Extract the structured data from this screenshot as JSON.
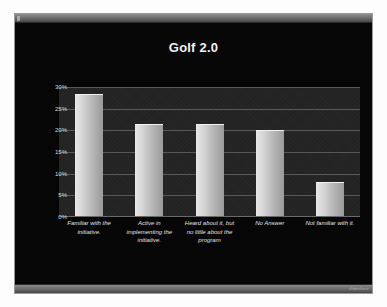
{
  "window": {
    "titlebar_label": "",
    "watermark": "slideshare"
  },
  "slide": {
    "title": "Golf 2.0"
  },
  "chart_data": {
    "type": "bar",
    "title": "Golf 2.0",
    "xlabel": "",
    "ylabel": "",
    "ylim": [
      0,
      30
    ],
    "grid": true,
    "legend": "none",
    "tick_format": "percent",
    "yticks": [
      "30%",
      "25%",
      "20%",
      "15%",
      "10%",
      "5%",
      "0%"
    ],
    "ytick_values": [
      30,
      25,
      20,
      15,
      10,
      5,
      0
    ],
    "categories": [
      "Familiar with the initiative.",
      "Active in implementing the initiative.",
      "Heard about it, but no little about the program",
      "No Answer",
      "Not familiar with it."
    ],
    "values": [
      28.5,
      21.5,
      21.5,
      20,
      8
    ],
    "bar_color": "#cfcfcf",
    "plot_background": "#242424",
    "slide_background": "#060606",
    "text_color": "#e2e2e2"
  }
}
